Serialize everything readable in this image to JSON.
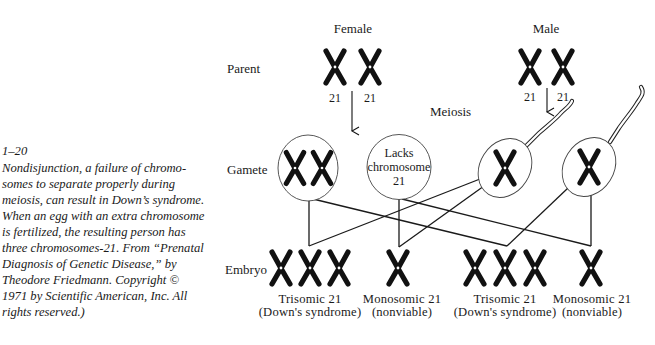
{
  "figure": {
    "number": "1–20",
    "caption_lines": [
      "Nondisjunction, a failure of chromo-",
      "somes to separate properly during",
      "meiosis, can result in Down’s syndrome.",
      "When an egg with an extra chromosome",
      "is fertilized, the resulting person has",
      "three chromosomes-21. From “Prenatal",
      "Diagnosis of Genetic Disease,” by",
      "Theodore Friedmann. Copyright ©",
      "1971 by Scientific American, Inc. All",
      "rights reserved.)"
    ]
  },
  "diagram": {
    "column_headers": {
      "female": "Female",
      "male": "Male"
    },
    "row_labels": {
      "parent": "Parent",
      "gamete": "Gamete",
      "embryo": "Embryo"
    },
    "process_label": "Meiosis",
    "parent_chromosome_labels": {
      "female": [
        "21",
        "21"
      ],
      "male": [
        "21",
        "21"
      ]
    },
    "gametes": {
      "egg_disomic": {
        "chromosome_count": 2
      },
      "egg_lacking": {
        "lines": [
          "Lacks",
          "chromosome",
          "21"
        ]
      },
      "sperm": [
        {
          "chromosome_count": 1
        },
        {
          "chromosome_count": 1
        }
      ]
    },
    "outcomes": [
      {
        "title": "Trisomic 21",
        "subtitle": "(Down's syndrome)",
        "chromosome_count": 3
      },
      {
        "title": "Monosomic 21",
        "subtitle": "(nonviable)",
        "chromosome_count": 1
      },
      {
        "title": "Trisomic 21",
        "subtitle": "(Down's syndrome)",
        "chromosome_count": 3
      },
      {
        "title": "Monosomic 21",
        "subtitle": "(nonviable)",
        "chromosome_count": 1
      }
    ]
  }
}
